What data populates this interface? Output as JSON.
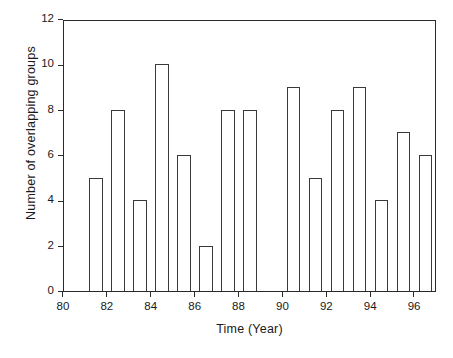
{
  "chart_data": {
    "type": "bar",
    "title": "",
    "xlabel": "Time (Year)",
    "ylabel": "Number of overlapping groups",
    "xlim": [
      80,
      97
    ],
    "ylim": [
      0,
      12
    ],
    "ytick_step": 2,
    "xtick_step": 2,
    "grid": false,
    "legend": null,
    "bar_color": "#ffffff",
    "bar_edge_color": "#3a3a3a",
    "axis_color": "#2a2a2a",
    "categories": [
      81,
      82,
      83,
      84,
      85,
      86,
      87,
      88,
      89,
      90,
      91,
      92,
      93,
      94,
      95,
      96
    ],
    "values": [
      5,
      8,
      4,
      10,
      6,
      2,
      8,
      8,
      0,
      9,
      5,
      8,
      9,
      4,
      7,
      6
    ],
    "xticks": [
      {
        "value": 80,
        "label": "80"
      },
      {
        "value": 82,
        "label": "82"
      },
      {
        "value": 84,
        "label": "84"
      },
      {
        "value": 86,
        "label": "86"
      },
      {
        "value": 88,
        "label": "88"
      },
      {
        "value": 90,
        "label": "90"
      },
      {
        "value": 92,
        "label": "92"
      },
      {
        "value": 94,
        "label": "94"
      },
      {
        "value": 96,
        "label": "96"
      }
    ],
    "yticks": [
      {
        "value": 0,
        "label": "0"
      },
      {
        "value": 2,
        "label": "2"
      },
      {
        "value": 4,
        "label": "4"
      },
      {
        "value": 6,
        "label": "6"
      },
      {
        "value": 8,
        "label": "8"
      },
      {
        "value": 10,
        "label": "10"
      },
      {
        "value": 12,
        "label": "12"
      }
    ]
  },
  "caption": {
    "text": ""
  }
}
